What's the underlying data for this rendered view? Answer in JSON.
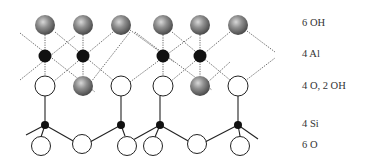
{
  "figure": {
    "type": "kaolinite-layer-structure",
    "labels": [
      {
        "id": "oh6",
        "text": "6 OH",
        "y": 17
      },
      {
        "id": "al4",
        "text": "4 Al",
        "y": 48
      },
      {
        "id": "o4oh2",
        "text": "4 O, 2 OH",
        "y": 80
      },
      {
        "id": "si4",
        "text": "4 Si",
        "y": 118
      },
      {
        "id": "o6",
        "text": "6 O",
        "y": 139
      }
    ],
    "colors": {
      "hydroxyl_gray": "#8a8a8a",
      "aluminum_black": "#111111",
      "oxygen_white": "#ffffff",
      "bond_solid": "#222222",
      "bond_dotted": "#666666"
    },
    "atoms": {
      "top_oh": [
        45,
        83,
        121,
        163,
        200,
        238
      ],
      "al": [
        45,
        83,
        163,
        200
      ],
      "mid_row": [
        {
          "x": 45,
          "kind": "O"
        },
        {
          "x": 83,
          "kind": "OH"
        },
        {
          "x": 121,
          "kind": "O"
        },
        {
          "x": 163,
          "kind": "O"
        },
        {
          "x": 200,
          "kind": "OH"
        },
        {
          "x": 238,
          "kind": "O"
        }
      ],
      "si": [
        45,
        121,
        160,
        238
      ],
      "bottom_o": [
        41,
        82,
        127,
        153,
        197,
        240
      ]
    }
  }
}
